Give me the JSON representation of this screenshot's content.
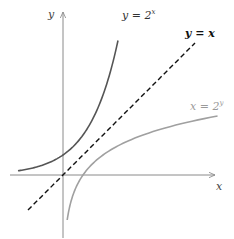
{
  "chart_data": {
    "type": "line",
    "title": "",
    "xlabel": "x",
    "ylabel": "y",
    "grid": false,
    "legend": "inline labels",
    "xlim": [
      -2.6,
      7.8
    ],
    "ylim": [
      -3.2,
      8.2
    ],
    "origin_px": [
      63,
      175
    ],
    "unit_px": 20,
    "series": [
      {
        "name": "y = 2^x",
        "label": "y = 2",
        "label_sup": "x",
        "color": "#555555",
        "style": "solid",
        "function": "exp2",
        "x": [
          -2.25,
          -2,
          -1,
          0,
          1,
          2,
          2.5,
          2.75
        ],
        "y": [
          0.21,
          0.25,
          0.5,
          1,
          2,
          4,
          5.66,
          6.73
        ]
      },
      {
        "name": "y = x",
        "label": "y = x",
        "color": "#111111",
        "style": "dashed",
        "function": "identity",
        "x": [
          -1.75,
          6.6
        ],
        "y": [
          -1.75,
          6.6
        ]
      },
      {
        "name": "x = 2^y",
        "label": "x = 2",
        "label_sup": "y",
        "color": "#a0a0a0",
        "style": "solid",
        "function": "log2",
        "x": [
          0.21,
          0.25,
          0.5,
          1,
          2,
          4,
          7.75
        ],
        "y": [
          -2.25,
          -2,
          -1,
          0,
          1,
          2,
          2.95
        ]
      }
    ]
  },
  "axes": {
    "x_label": "x",
    "y_label": "y"
  },
  "labels": {
    "exp": {
      "base": "y = 2",
      "sup": "x"
    },
    "identity": "y = x",
    "log": {
      "base": "x = 2",
      "sup": "y"
    }
  },
  "colors": {
    "axis": "#8a8a8a",
    "exp_curve": "#555555",
    "identity_line": "#111111",
    "log_curve": "#a0a0a0",
    "exp_label": "#333333",
    "log_label": "#9a9a9a"
  }
}
